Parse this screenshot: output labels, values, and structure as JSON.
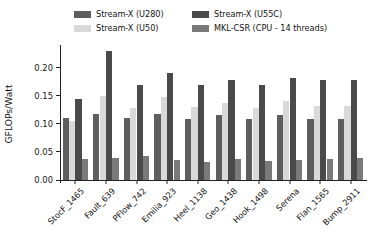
{
  "chart_data": {
    "type": "bar",
    "title": "",
    "xlabel": "",
    "ylabel": "GFLOPs/Watt",
    "ylim": [
      0.0,
      0.235
    ],
    "yticks": [
      0.0,
      0.05,
      0.1,
      0.15,
      0.2
    ],
    "ytick_labels": [
      "0.00",
      "0.05",
      "0.10",
      "0.15",
      "0.20"
    ],
    "grid": false,
    "legend_position": "upper center",
    "categories": [
      "StocF_1465",
      "Fault_639",
      "PFlow_742",
      "Emilia_923",
      "Heel_1138",
      "Geo_1438",
      "Hook_1498",
      "Serena",
      "Flan_1565",
      "Bump_2911"
    ],
    "series": [
      {
        "name": "Stream-X (U280)",
        "color": "#5e5e5e",
        "values": [
          0.11,
          0.118,
          0.11,
          0.118,
          0.108,
          0.115,
          0.108,
          0.115,
          0.108,
          0.108
        ]
      },
      {
        "name": "Stream-X (U50)",
        "color": "#d9d9d9",
        "values": [
          0.105,
          0.15,
          0.128,
          0.148,
          0.13,
          0.138,
          0.128,
          0.14,
          0.132,
          0.132
        ]
      },
      {
        "name": "Stream-X (U55C)",
        "color": "#4a4a4a",
        "values": [
          0.145,
          0.23,
          0.17,
          0.19,
          0.17,
          0.178,
          0.17,
          0.182,
          0.178,
          0.178
        ]
      },
      {
        "name": "MKL-CSR (CPU - 14 threads)",
        "color": "#7a7a7a",
        "values": [
          0.037,
          0.04,
          0.042,
          0.036,
          0.032,
          0.037,
          0.033,
          0.035,
          0.038,
          0.04
        ]
      }
    ]
  },
  "legend": {
    "entries": [
      {
        "label": "Stream-X (U280)",
        "color": "#5e5e5e"
      },
      {
        "label": "Stream-X (U55C)",
        "color": "#4a4a4a"
      },
      {
        "label": "Stream-X (U50)",
        "color": "#d9d9d9"
      },
      {
        "label": "MKL-CSR (CPU - 14 threads)",
        "color": "#7a7a7a"
      }
    ]
  },
  "axes": {
    "y_title": "GFLOPs/Watt"
  }
}
